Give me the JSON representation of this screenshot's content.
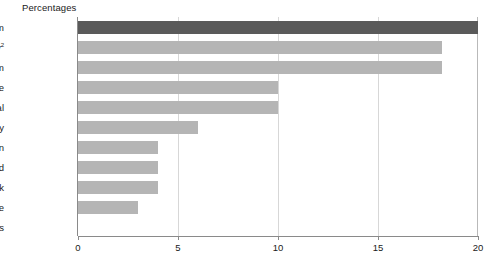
{
  "chart_data": {
    "type": "bar",
    "orientation": "horizontal",
    "title": "Percentages",
    "xlabel": "",
    "ylabel": "",
    "xlim": [
      0,
      20
    ],
    "xticks": [
      0,
      5,
      10,
      15,
      20
    ],
    "xtick_labels": [
      "0",
      "5",
      "10",
      "15",
      "20"
    ],
    "grid": "vertical-light",
    "legend": "none",
    "categories": [
      "United Kingdom",
      "Germany",
      "Belgium",
      "France",
      "Portugal",
      "Italy",
      "Spain",
      "Ireland",
      "Denmark",
      "Greece",
      "Netherlands"
    ],
    "values": [
      20,
      18.2,
      18.2,
      10,
      10,
      6,
      4,
      4,
      4,
      3,
      0
    ],
    "bars": [
      {
        "label": "United Kingdom",
        "footnote": "",
        "value": 20,
        "color": "#5a5a5a",
        "highlight": true
      },
      {
        "label": "Germany",
        "footnote": "2",
        "value": 18.2,
        "color": "#b5b5b5",
        "highlight": false
      },
      {
        "label": "Belgium",
        "footnote": "",
        "value": 18.2,
        "color": "#b5b5b5",
        "highlight": false
      },
      {
        "label": "France",
        "footnote": "",
        "value": 10,
        "color": "#b5b5b5",
        "highlight": false
      },
      {
        "label": "Portugal",
        "footnote": "",
        "value": 10,
        "color": "#b5b5b5",
        "highlight": false
      },
      {
        "label": "Italy",
        "footnote": "",
        "value": 6,
        "color": "#b5b5b5",
        "highlight": false
      },
      {
        "label": "Spain",
        "footnote": "",
        "value": 4,
        "color": "#b5b5b5",
        "highlight": false
      },
      {
        "label": "Ireland",
        "footnote": "",
        "value": 4,
        "color": "#b5b5b5",
        "highlight": false
      },
      {
        "label": "Denmark",
        "footnote": "",
        "value": 4,
        "color": "#b5b5b5",
        "highlight": false
      },
      {
        "label": "Greece",
        "footnote": "",
        "value": 3,
        "color": "#b5b5b5",
        "highlight": false
      },
      {
        "label": "Netherlands",
        "footnote": "",
        "value": 0,
        "color": "#b5b5b5",
        "highlight": false
      }
    ],
    "colors": {
      "bar_default": "#b5b5b5",
      "bar_highlight": "#5a5a5a",
      "axis": "#8a8a8a",
      "gridline": "#d7d7d7",
      "text": "#1a1a1a",
      "background": "#ffffff"
    }
  }
}
